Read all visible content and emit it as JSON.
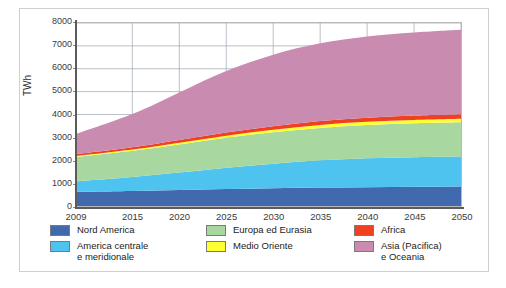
{
  "chart_data": {
    "type": "area",
    "stacked": true,
    "title": "",
    "xlabel": "",
    "ylabel": "TWh",
    "ylim": [
      0,
      8000
    ],
    "ytick_step": 1000,
    "yticks": [
      0,
      1000,
      2000,
      3000,
      4000,
      5000,
      6000,
      7000,
      8000
    ],
    "xlim": [
      2009,
      2050
    ],
    "categories": [
      2009,
      2015,
      2020,
      2025,
      2030,
      2035,
      2040,
      2045,
      2050
    ],
    "tick_labels": [
      "2009",
      "2015",
      "2020",
      "2025",
      "2030",
      "2035",
      "2040",
      "2045",
      "2050"
    ],
    "grid": true,
    "legend_position": "bottom",
    "series": [
      {
        "name": "Nord America",
        "color": "#4169ae",
        "values": [
          620,
          660,
          700,
          740,
          775,
          805,
          825,
          840,
          855
        ]
      },
      {
        "name": "America centrale\ne meridionale",
        "color": "#4fc3f0",
        "values": [
          460,
          610,
          760,
          930,
          1075,
          1190,
          1260,
          1295,
          1310
        ]
      },
      {
        "name": "Europa ed Eurasia",
        "color": "#a8d8a0",
        "values": [
          1060,
          1140,
          1230,
          1310,
          1370,
          1420,
          1455,
          1480,
          1495
        ]
      },
      {
        "name": "Medio Oriente",
        "color": "#ffff33",
        "values": [
          40,
          55,
          75,
          95,
          115,
          130,
          140,
          148,
          155
        ]
      },
      {
        "name": "Africa",
        "color": "#f0401f",
        "values": [
          90,
          105,
          120,
          135,
          152,
          168,
          180,
          190,
          198
        ]
      },
      {
        "name": "Asia (Pacifica)\ne Oceania",
        "color": "#c98bb0",
        "values": [
          880,
          1450,
          2080,
          2690,
          3130,
          3400,
          3550,
          3630,
          3690
        ]
      }
    ],
    "totals": [
      3150,
      4020,
      4965,
      5900,
      6617,
      7113,
      7410,
      7583,
      7703
    ]
  },
  "legend": {
    "columns": [
      {
        "entries": [
          {
            "label": "Nord America",
            "color": "#4169ae",
            "series_index": 0
          },
          {
            "label": "America centrale\ne meridionale",
            "color": "#4fc3f0",
            "series_index": 1
          }
        ]
      },
      {
        "entries": [
          {
            "label": "Europa ed Eurasia",
            "color": "#a8d8a0",
            "series_index": 2
          },
          {
            "label": "Medio Oriente",
            "color": "#ffff33",
            "series_index": 3
          }
        ]
      },
      {
        "entries": [
          {
            "label": "Africa",
            "color": "#f0401f",
            "series_index": 4
          },
          {
            "label": "Asia (Pacifica)\ne Oceania",
            "color": "#c98bb0",
            "series_index": 5
          }
        ]
      }
    ]
  },
  "colors": {
    "axis": "#5b5b5b",
    "grid": "#9aa3b0",
    "frame": "#cfcfcf",
    "plot_border": "#b9b9b9",
    "text": "#1c1c1c"
  }
}
